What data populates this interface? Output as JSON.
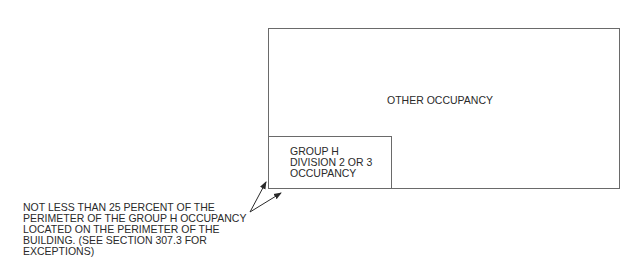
{
  "diagram": {
    "type": "building-occupancy-plan",
    "outer_region": {
      "label": "OTHER OCCUPANCY"
    },
    "inner_region": {
      "label_lines": [
        "GROUP H",
        "DIVISION 2 OR 3",
        "OCCUPANCY"
      ]
    },
    "callout": {
      "note_lines": [
        "NOT LESS THAN 25 PERCENT OF THE",
        "PERIMETER OF THE GROUP H OCCUPANCY",
        "LOCATED ON THE PERIMETER OF THE",
        "BUILDING. (SEE SECTION 307.3 FOR",
        "EXCEPTIONS)"
      ],
      "arrow_count": 2
    },
    "colors": {
      "line": "#6a6a6a",
      "text": "#2a2a2a",
      "background": "#ffffff"
    }
  }
}
